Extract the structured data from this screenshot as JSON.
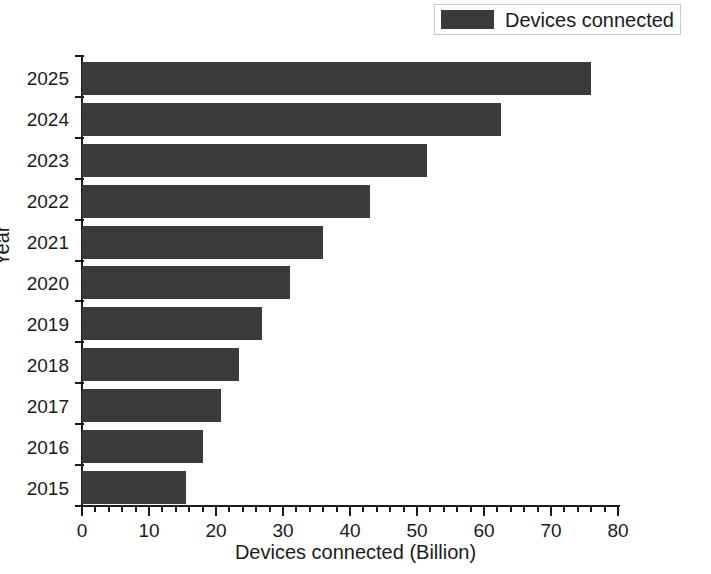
{
  "chart_data": {
    "type": "bar",
    "orientation": "horizontal",
    "title": "",
    "xlabel": "Devices connected (Billion)",
    "ylabel": "Year",
    "categories": [
      "2025",
      "2024",
      "2023",
      "2022",
      "2021",
      "2020",
      "2019",
      "2018",
      "2017",
      "2016",
      "2015"
    ],
    "values": [
      76.0,
      62.5,
      51.5,
      43.0,
      36.0,
      31.0,
      26.8,
      23.4,
      20.7,
      18.0,
      15.5
    ],
    "series": [
      {
        "name": "Devices connected",
        "color": "#3b3b3b",
        "values": [
          76.0,
          62.5,
          51.5,
          43.0,
          36.0,
          31.0,
          26.8,
          23.4,
          20.7,
          18.0,
          15.5
        ]
      }
    ],
    "xlim": [
      0,
      80
    ],
    "xticks": [
      0,
      10,
      20,
      30,
      40,
      50,
      60,
      70,
      80
    ],
    "xtick_labels": [
      "0",
      "10",
      "20",
      "30",
      "40",
      "50",
      "60",
      "70",
      "80"
    ],
    "minor_ticks_per_interval": 5,
    "grid": false,
    "legend": {
      "position": "top-right",
      "entries": [
        {
          "label": "Devices connected",
          "color": "#3b3b3b"
        }
      ]
    }
  },
  "axes": {
    "x_title": "Devices connected (Billion)",
    "y_title": "Year"
  },
  "legend": {
    "label": "Devices connected"
  },
  "colors": {
    "bar": "#3b3b3b",
    "axis": "#1b1b1b",
    "background": "#ffffff",
    "legend_border": "#c9c9c9"
  }
}
